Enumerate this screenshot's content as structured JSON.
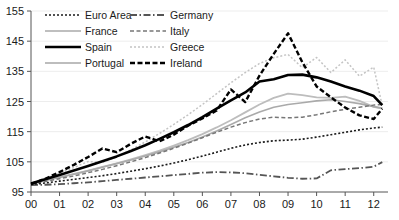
{
  "chart_data": {
    "type": "line",
    "title": "",
    "subtitle": "",
    "xlabel": "",
    "ylabel": "",
    "xlim": [
      0,
      12.5
    ],
    "ylim": [
      95,
      155
    ],
    "grid": true,
    "legend_position": "top-left",
    "x": [
      0,
      0.5,
      1,
      1.5,
      2,
      2.5,
      3,
      3.5,
      4,
      4.5,
      5,
      5.5,
      6,
      6.5,
      7,
      7.5,
      8,
      8.5,
      9,
      9.5,
      10,
      10.5,
      11,
      11.5,
      12,
      12.3
    ],
    "xtick_labels": [
      "00",
      "01",
      "02",
      "03",
      "04",
      "05",
      "06",
      "07",
      "08",
      "09",
      "10",
      "11",
      "12"
    ],
    "xtick_values": [
      0,
      1,
      2,
      3,
      4,
      5,
      6,
      7,
      8,
      9,
      10,
      11,
      12
    ],
    "ytick_labels": [
      "95",
      "105",
      "115",
      "125",
      "135",
      "145",
      "155"
    ],
    "ytick_values": [
      95,
      105,
      115,
      125,
      135,
      145,
      155
    ],
    "series": [
      {
        "name": "Euro Area",
        "style": "fine-dotted",
        "color": "#1a1a1a",
        "width": 1.6,
        "dash": "2,2",
        "values": [
          97.5,
          98.0,
          98.6,
          99.2,
          99.8,
          100.4,
          101.1,
          101.9,
          102.7,
          103.6,
          104.6,
          105.7,
          106.9,
          108.2,
          109.5,
          110.6,
          111.4,
          112.0,
          112.2,
          112.5,
          113.2,
          114.0,
          114.8,
          115.6,
          116.2,
          116.5
        ]
      },
      {
        "name": "Germany",
        "style": "dash-dot",
        "color": "#555555",
        "width": 1.8,
        "dash": "7,2.5,1.5,2.5",
        "values": [
          97.3,
          97.4,
          97.6,
          97.9,
          98.2,
          98.6,
          99.0,
          99.4,
          99.8,
          100.2,
          100.6,
          101.0,
          101.4,
          101.6,
          101.5,
          101.2,
          100.7,
          100.2,
          99.7,
          99.4,
          99.5,
          102.2,
          102.6,
          102.9,
          103.4,
          104.9
        ]
      },
      {
        "name": "France",
        "style": "solid-light",
        "color": "#aaaaaa",
        "width": 1.6,
        "dash": "",
        "values": [
          97.8,
          98.8,
          99.8,
          100.9,
          102.0,
          103.2,
          104.4,
          105.6,
          106.9,
          108.3,
          109.8,
          111.4,
          113.2,
          115.2,
          117.4,
          119.6,
          121.5,
          123.1,
          124.0,
          124.6,
          125.2,
          125.6,
          125.0,
          124.3,
          123.3,
          122.8
        ]
      },
      {
        "name": "Italy",
        "style": "dashed-gray",
        "color": "#777777",
        "width": 1.5,
        "dash": "4,2.5",
        "values": [
          97.6,
          98.5,
          99.4,
          100.3,
          101.4,
          102.5,
          103.7,
          105.0,
          106.4,
          107.9,
          109.5,
          111.2,
          113.0,
          114.8,
          116.5,
          118.0,
          119.2,
          119.8,
          119.6,
          119.8,
          120.6,
          121.6,
          122.4,
          123.1,
          123.8,
          124.0
        ]
      },
      {
        "name": "Spain",
        "style": "solid-thick",
        "color": "#000000",
        "width": 2.6,
        "dash": "",
        "values": [
          97.8,
          99.2,
          100.6,
          102.1,
          103.6,
          105.2,
          106.8,
          108.6,
          110.5,
          112.6,
          114.8,
          117.2,
          119.8,
          122.6,
          125.4,
          128.0,
          131.6,
          132.4,
          133.8,
          133.9,
          133.0,
          131.6,
          130.0,
          128.6,
          126.8,
          123.8
        ]
      },
      {
        "name": "Greece",
        "style": "light-dotted",
        "color": "#c4c4c4",
        "width": 1.5,
        "dash": "2,2",
        "values": [
          97.7,
          99.4,
          101.2,
          103.1,
          105.1,
          104.8,
          106.6,
          109.0,
          111.6,
          114.4,
          117.4,
          120.6,
          124.0,
          127.6,
          131.2,
          134.6,
          137.6,
          139.5,
          140.6,
          136.2,
          139.6,
          134.6,
          138.8,
          133.4,
          136.4,
          123.5
        ]
      },
      {
        "name": "Portugal",
        "style": "solid-light",
        "color": "#bdbdbd",
        "width": 1.8,
        "dash": "",
        "values": [
          97.9,
          98.9,
          99.9,
          101.0,
          102.1,
          103.3,
          104.5,
          105.8,
          107.2,
          108.7,
          110.4,
          112.2,
          114.2,
          116.4,
          118.8,
          121.4,
          124.0,
          126.2,
          127.6,
          127.1,
          126.4,
          126.2,
          126.6,
          125.2,
          123.2,
          122.6
        ]
      },
      {
        "name": "Ireland",
        "style": "thick-dashed",
        "color": "#000000",
        "width": 2.4,
        "dash": "5,2.5",
        "values": [
          97.6,
          99.4,
          101.6,
          104.0,
          106.6,
          109.4,
          108.2,
          111.0,
          113.4,
          111.8,
          114.0,
          117.0,
          119.4,
          122.0,
          129.0,
          124.8,
          133.6,
          140.8,
          147.6,
          138.0,
          130.0,
          126.4,
          123.0,
          120.4,
          119.2,
          122.6
        ]
      }
    ]
  },
  "legend": {
    "entries": [
      {
        "label": "Euro Area",
        "series": "Euro Area",
        "column": "left",
        "row": 0
      },
      {
        "label": "Germany",
        "series": "Germany",
        "column": "right",
        "row": 0
      },
      {
        "label": "France",
        "series": "France",
        "column": "left",
        "row": 1
      },
      {
        "label": "Italy",
        "series": "Italy",
        "column": "right",
        "row": 1
      },
      {
        "label": "Spain",
        "series": "Spain",
        "column": "left",
        "row": 2
      },
      {
        "label": "Greece",
        "series": "Greece",
        "column": "right",
        "row": 2
      },
      {
        "label": "Portugal",
        "series": "Portugal",
        "column": "left",
        "row": 3
      },
      {
        "label": "Ireland",
        "series": "Ireland",
        "column": "right",
        "row": 3
      }
    ]
  },
  "colors": {
    "axis": "#555555",
    "grid": "#ededed",
    "background": "#ffffff",
    "text": "#1a1a1a"
  }
}
